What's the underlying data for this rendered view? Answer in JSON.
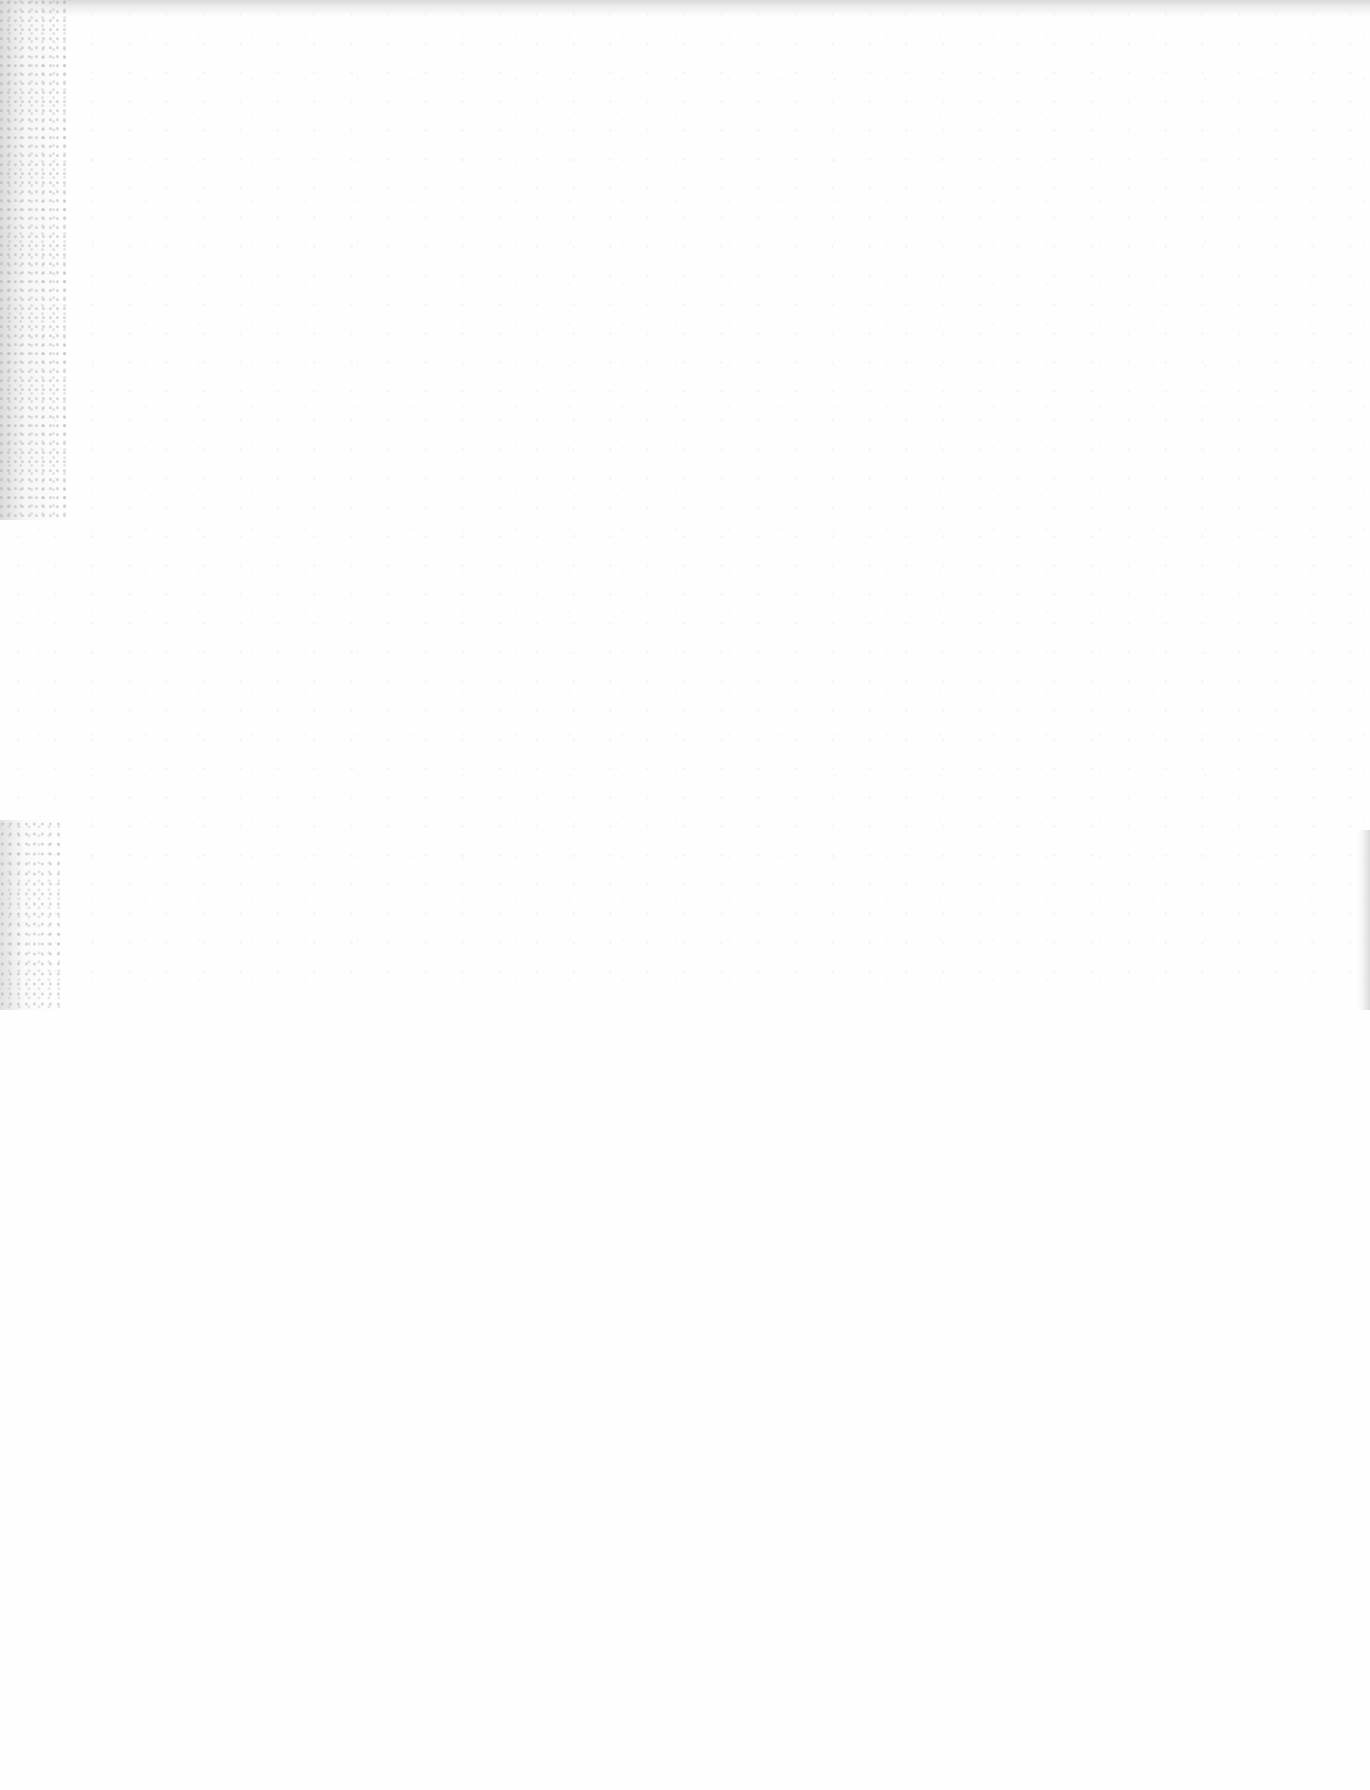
{
  "page": {
    "type": "blank scanned page",
    "background_color": "#ffffff",
    "noise_color": "#c8c8c8",
    "visible_text": []
  }
}
